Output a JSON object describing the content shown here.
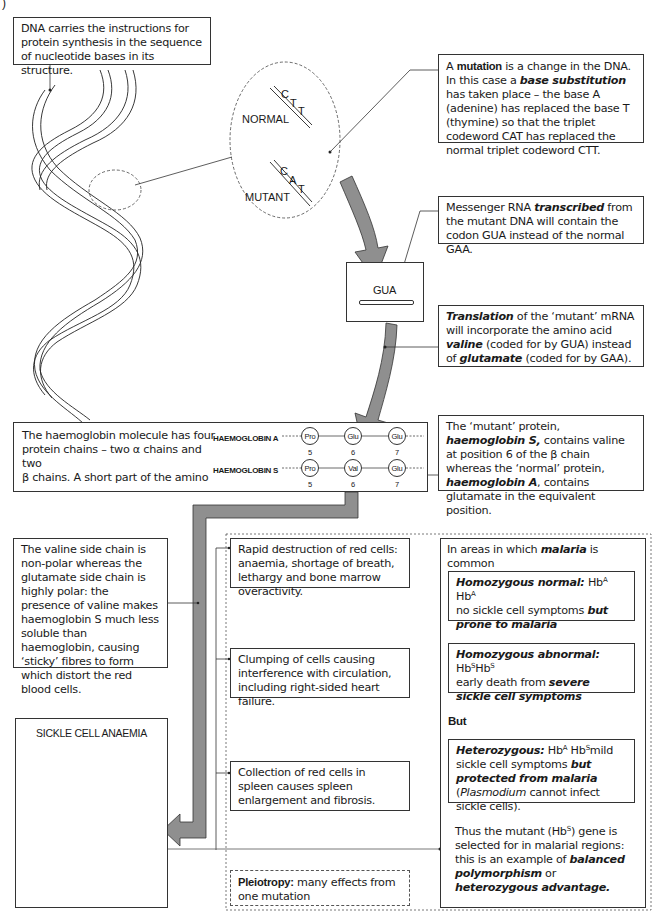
{
  "page_marker": ")",
  "dna_box": {
    "text": "DNA carries the instructions for protein synthesis in the sequence of nucleotide bases in its structure."
  },
  "zoom_inset": {
    "normal_label": "NORMAL",
    "normal_bases": [
      "C",
      "T",
      "T"
    ],
    "mutant_label": "MUTANT",
    "mutant_bases": [
      "C",
      "A",
      "T"
    ]
  },
  "mutation_box": {
    "pre": "A ",
    "term1": "mutation",
    "mid1": " is a change in the DNA. In this case a ",
    "term2": "base substitution",
    "post": " has taken place – the base A (adenine) has replaced the base T (thymine) so that the triplet codeword CAT has replaced the normal triplet codeword CTT."
  },
  "mrna_box": {
    "pre": "Messenger RNA ",
    "term": "transcribed",
    "post": " from the mutant DNA will contain the codon GUA instead of the normal GAA."
  },
  "codon_box": {
    "label": "GUA"
  },
  "translation_box": {
    "term1": "Translation",
    "mid1": " of the ‘mutant’ mRNA will incorporate the amino acid ",
    "term2": "valine",
    "mid2": " (coded for by GUA) instead of ",
    "term3": "glutamate",
    "post": " (coded for by GAA)."
  },
  "haemoglobin_box": {
    "text_line1": "The haemoglobin molecule has four",
    "text_line2": "protein chains – two α chains and two",
    "text_line3": "β chains.  A short part of the amino",
    "chains": [
      {
        "label": "HAEMOGLOBIN A",
        "residues": [
          {
            "aa": "Pro",
            "pos": "5"
          },
          {
            "aa": "Glu",
            "pos": "6"
          },
          {
            "aa": "Glu",
            "pos": "7"
          }
        ]
      },
      {
        "label": "HAEMOGLOBIN S",
        "residues": [
          {
            "aa": "Pro",
            "pos": "5"
          },
          {
            "aa": "Val",
            "pos": "6"
          },
          {
            "aa": "Glu",
            "pos": "7"
          }
        ]
      }
    ]
  },
  "mutant_protein_box": {
    "pre": "The ‘mutant’ protein, ",
    "term1": "haemoglobin S,",
    "mid1": " contains valine at position 6 of the β chain whereas the ‘normal’ protein, ",
    "term2": "haemoglobin A",
    "post": ", contains glutamate in the equivalent position."
  },
  "valine_box": {
    "text": "The valine side chain is non-polar whereas the glutamate side chain is highly polar: the presence of valine makes haemoglobin S much less soluble than haemoglobin, causing ‘sticky’ fibres to form which distort the red blood cells."
  },
  "sickle_box": {
    "title": "SICKLE CELL ANAEMIA"
  },
  "effects": [
    {
      "text": "Rapid destruction of red cells: anaemia, shortage of breath, lethargy and bone marrow overactivity."
    },
    {
      "text": "Clumping of cells causing interference with circulation, including right-sided heart failure."
    },
    {
      "text": "Collection of red cells in spleen causes spleen enlargement and fibrosis."
    }
  ],
  "pleiotropy_box": {
    "term": "Pleiotropy:",
    "text": " many effects from one mutation"
  },
  "malaria_panel": {
    "heading_pre": "In areas in which ",
    "heading_term": "malaria",
    "heading_post": " is common",
    "homozygous_normal": {
      "term": "Homozygous normal:",
      "genotype": " Hb",
      "sup1": "A",
      "genotype2": " Hb",
      "sup2": "A",
      "text": " no sickle cell symptoms ",
      "emph": "but prone to malaria"
    },
    "homozygous_abnormal": {
      "term": "Homozygous abnormal:",
      "genotype": " Hb",
      "sup1": "S",
      "genotype2": "Hb",
      "sup2": "S",
      "text": " early death from ",
      "emph": "severe sickle cell symptoms"
    },
    "but_label": "But",
    "heterozygous": {
      "term": "Heterozygous:",
      "genotype": " Hb",
      "sup1": "A",
      "genotype2": " Hb",
      "sup2": "S",
      "text": "mild sickle cell symptoms ",
      "emph": "but protected from malaria",
      "paren_pre": " (",
      "organism": "Plasmodium",
      "paren_post": " cannot infect sickle cells)."
    },
    "conclusion": {
      "pre": "Thus the mutant (Hb",
      "sup": "S",
      "mid": ") gene is selected for in malarial regions: this is an example of ",
      "term1": "balanced polymorphism",
      "or": " or ",
      "term2": "heterozygous advantage."
    }
  },
  "colors": {
    "arrow_fill": "#8f8f8f",
    "line": "#333333",
    "background": "#ffffff"
  }
}
